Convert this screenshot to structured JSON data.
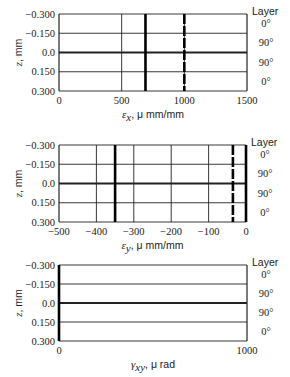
{
  "chart_data": [
    {
      "type": "line",
      "title": "",
      "xlabel": "ε_x, μ mm/mm",
      "xlabel_parts": {
        "symbol": "ε",
        "sub": "x",
        "rest": ", μ mm/mm"
      },
      "ylabel": "z, mm",
      "xlim": [
        0,
        1500
      ],
      "ylim": [
        -0.3,
        0.3
      ],
      "xticks": [
        "0",
        "500",
        "1000",
        "1500"
      ],
      "yticks": [
        "−0.300",
        "−0.150",
        "0.0",
        "0.150",
        "0.300"
      ],
      "right_legend_title": "Layer",
      "layers": [
        "0°",
        "90°",
        "90°",
        "0°"
      ],
      "series": [
        {
          "name": "strain",
          "style": "solid-thick",
          "x": 690,
          "z_range": [
            -0.3,
            0.3
          ]
        },
        {
          "name": "strain-alt",
          "style": "dashed-thick",
          "x": 1000,
          "z_range": [
            -0.3,
            0.3
          ]
        }
      ],
      "grid": true
    },
    {
      "type": "line",
      "title": "",
      "xlabel": "ε_y, μ mm/mm",
      "xlabel_parts": {
        "symbol": "ε",
        "sub": "y",
        "rest": ", μ mm/mm"
      },
      "ylabel": "z, mm",
      "xlim": [
        -500,
        0
      ],
      "ylim": [
        -0.3,
        0.3
      ],
      "xticks": [
        "−500",
        "−400",
        "−300",
        "−200",
        "−100",
        "0"
      ],
      "yticks": [
        "−0.300",
        "−0.150",
        "0.0",
        "0.150",
        "0.300"
      ],
      "right_legend_title": "Layer",
      "layers": [
        "0°",
        "90°",
        "90°",
        "0°"
      ],
      "series": [
        {
          "name": "strain",
          "style": "solid-thick",
          "x": -350,
          "z_range": [
            -0.3,
            0.3
          ]
        },
        {
          "name": "strain-alt",
          "style": "dashed-thick",
          "x": -35,
          "z_range": [
            -0.3,
            0.3
          ]
        },
        {
          "name": "zero",
          "style": "solid-thick",
          "x": 0,
          "z_range": [
            -0.3,
            0.3
          ]
        }
      ],
      "grid": true
    },
    {
      "type": "line",
      "title": "",
      "xlabel": "γ_xy, μ rad",
      "xlabel_parts": {
        "symbol": "γ",
        "sub": "xy",
        "rest": ", μ rad"
      },
      "ylabel": "z, mm",
      "xlim": [
        0,
        1000
      ],
      "ylim": [
        -0.3,
        0.3
      ],
      "xticks": [
        "0",
        "1000"
      ],
      "yticks": [
        "−0.300",
        "−0.150",
        "0.0",
        "0.150",
        "0.300"
      ],
      "right_legend_title": "Layer",
      "layers": [
        "0°",
        "90°",
        "90°",
        "0°"
      ],
      "series": [
        {
          "name": "shear-strain",
          "style": "solid-thick",
          "x": 0,
          "z_range": [
            -0.3,
            0.3
          ]
        }
      ],
      "grid": false
    }
  ]
}
